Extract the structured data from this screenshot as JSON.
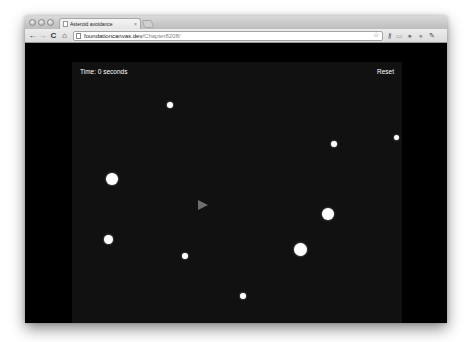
{
  "browser": {
    "tab": {
      "title": "Asteroid avoidance",
      "close_glyph": "×"
    },
    "nav": {
      "back": "←",
      "forward": "→",
      "reload": "C",
      "home": "⌂"
    },
    "url": {
      "host": "foundationcanvas.dev",
      "path": "/Chapter8208/"
    },
    "toolbar_icons": [
      "star-icon",
      "wrench-key-icon",
      "page-icon",
      "extension-icon",
      "extension-icon-2",
      "wrench-icon"
    ],
    "toolbar_glyphs": {
      "star": "☆",
      "key": "⚷",
      "page": "▭",
      "ext1": "●",
      "ext2": "●",
      "wrench": "✎"
    }
  },
  "game": {
    "hud": {
      "time_label": "Time: 0 seconds",
      "reset_label": "Reset"
    },
    "colors": {
      "page_background": "#000000",
      "canvas_background": "#111111",
      "asteroid": "#ffffff",
      "ship": "#6e6e6e",
      "hud_text": "#ffffff"
    },
    "ship": {
      "x": 126,
      "y": 143,
      "direction": "right"
    },
    "asteroids": [
      {
        "x": 98,
        "y": 43,
        "r": 3
      },
      {
        "x": 40,
        "y": 117,
        "r": 6
      },
      {
        "x": 36,
        "y": 177,
        "r": 4.5
      },
      {
        "x": 113,
        "y": 194,
        "r": 3
      },
      {
        "x": 171,
        "y": 234,
        "r": 3
      },
      {
        "x": 228,
        "y": 187,
        "r": 6.5
      },
      {
        "x": 256,
        "y": 152,
        "r": 6
      },
      {
        "x": 262,
        "y": 82,
        "r": 3
      },
      {
        "x": 324,
        "y": 75,
        "r": 2.5
      }
    ]
  }
}
